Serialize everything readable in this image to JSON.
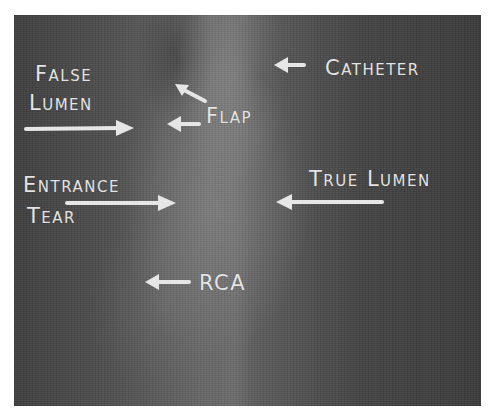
{
  "figure": {
    "type": "annotated-angiogram",
    "colors": {
      "label": "#e4e4e4",
      "background": "#4a4a4a",
      "page": "#ffffff"
    }
  },
  "labels": {
    "false_lumen_line1": "False",
    "false_lumen_line2": "Lumen",
    "flap": "Flap",
    "catheter": "Catheter",
    "entrance_tear_line1": "Entrance",
    "entrance_tear_line2": "Tear",
    "true_lumen": "True Lumen",
    "rca": "RCA"
  },
  "arrows": [
    {
      "name": "false-lumen-arrow",
      "direction": "right"
    },
    {
      "name": "flap-arrow-upper",
      "direction": "up-left"
    },
    {
      "name": "flap-arrow-lower",
      "direction": "left"
    },
    {
      "name": "catheter-arrow",
      "direction": "left"
    },
    {
      "name": "entrance-tear-arrow",
      "direction": "right"
    },
    {
      "name": "true-lumen-arrow",
      "direction": "left"
    },
    {
      "name": "rca-arrow",
      "direction": "left"
    }
  ]
}
